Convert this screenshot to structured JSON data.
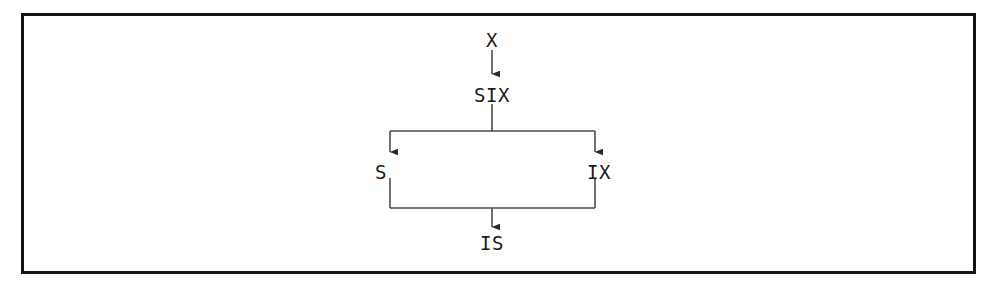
{
  "figure": {
    "frame": {
      "border_color": "#141414",
      "background_color": "#ffffff"
    },
    "line_color": "#4d4d4d",
    "text_color": "#1a1a1a"
  },
  "diagram": {
    "type": "flow-tree",
    "nodes": [
      {
        "id": "x",
        "label": "X",
        "role": "root-input",
        "x": 492,
        "y": 40
      },
      {
        "id": "six",
        "label": "SIX",
        "role": "combined",
        "x": 492,
        "y": 95
      },
      {
        "id": "s",
        "label": "S",
        "role": "left-branch",
        "x": 391,
        "y": 172
      },
      {
        "id": "ix",
        "label": "IX",
        "role": "right-branch",
        "x": 594,
        "y": 172
      },
      {
        "id": "is",
        "label": "IS",
        "role": "result",
        "x": 492,
        "y": 243
      }
    ],
    "edges": [
      {
        "from": "x",
        "to": "six",
        "arrow": true
      },
      {
        "from": "six",
        "to": "s",
        "arrow": true
      },
      {
        "from": "six",
        "to": "ix",
        "arrow": true
      },
      {
        "from": "s",
        "to": "is",
        "arrow": true
      },
      {
        "from": "ix",
        "to": "is",
        "arrow": true
      }
    ]
  }
}
